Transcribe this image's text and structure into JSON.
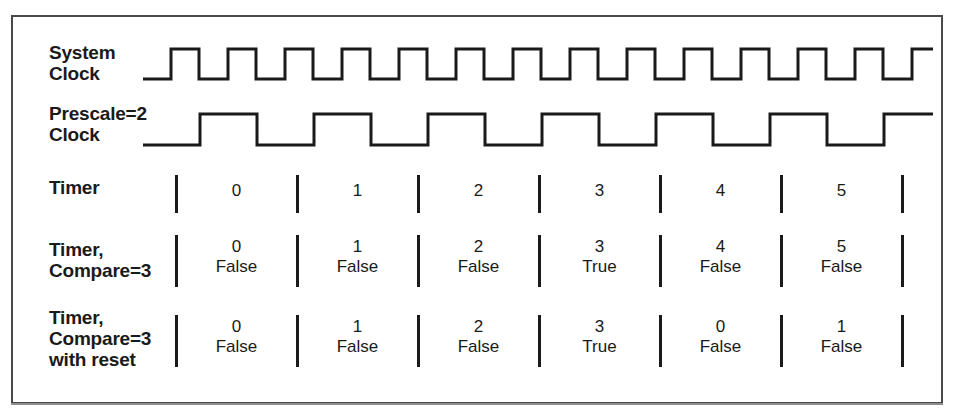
{
  "figure": {
    "type": "timing-diagram",
    "rows": [
      {
        "id": "system-clock",
        "label": "System\nClock",
        "kind": "waveform",
        "waveform": {
          "name": "system-clock-waveform",
          "lead_in_px": 28,
          "period_px": 57,
          "cycles": 13,
          "start_level": "low",
          "end_level": "high"
        }
      },
      {
        "id": "prescale-clock",
        "label": "Prescale=2\nClock",
        "kind": "waveform",
        "waveform": {
          "name": "prescale-clock-waveform",
          "lead_in_px": 57,
          "period_px": 114,
          "cycles": 6,
          "start_level": "low",
          "end_level": "high"
        }
      },
      {
        "id": "timer",
        "label": "Timer",
        "kind": "values",
        "lines": 1,
        "cells": [
          {
            "num": "0"
          },
          {
            "num": "1"
          },
          {
            "num": "2"
          },
          {
            "num": "3"
          },
          {
            "num": "4"
          },
          {
            "num": "5"
          }
        ]
      },
      {
        "id": "timer-compare-3",
        "label": "Timer,\nCompare=3",
        "kind": "values",
        "lines": 2,
        "cells": [
          {
            "num": "0",
            "bool": "False"
          },
          {
            "num": "1",
            "bool": "False"
          },
          {
            "num": "2",
            "bool": "False"
          },
          {
            "num": "3",
            "bool": "True"
          },
          {
            "num": "4",
            "bool": "False"
          },
          {
            "num": "5",
            "bool": "False"
          }
        ]
      },
      {
        "id": "timer-compare-3-with-reset",
        "label": "Timer,\nCompare=3\nwith reset",
        "kind": "values",
        "lines": 2,
        "cells": [
          {
            "num": "0",
            "bool": "False"
          },
          {
            "num": "1",
            "bool": "False"
          },
          {
            "num": "2",
            "bool": "False"
          },
          {
            "num": "3",
            "bool": "True"
          },
          {
            "num": "0",
            "bool": "False"
          },
          {
            "num": "1",
            "bool": "False"
          }
        ]
      }
    ],
    "grid": {
      "tick_x": [
        173,
        294,
        415,
        536,
        657,
        778,
        899
      ],
      "tick_count": 7
    },
    "colors": {
      "ink": "#1a1a1a",
      "frame": "#4a4a4a",
      "paper": "#ffffff"
    }
  }
}
